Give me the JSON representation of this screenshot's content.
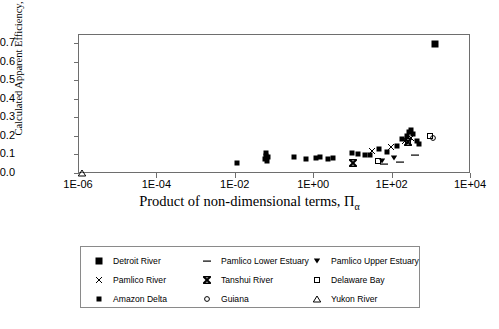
{
  "chart_data": {
    "type": "scatter",
    "title": "",
    "xlabel": "Product of non-dimensional terms, Π",
    "xlabel_sub": "α",
    "ylabel": "Calculated Apparent Efficiency, α'",
    "xscale": "log",
    "yscale": "linear",
    "xlim": [
      1e-06,
      10000.0
    ],
    "ylim": [
      0.0,
      0.75
    ],
    "grid": false,
    "legend_position": "below-plot",
    "xticks": [
      "1E-06",
      "1E-04",
      "1E-02",
      "1E+00",
      "1E+02",
      "1E+04"
    ],
    "xtick_values": [
      1e-06,
      0.0001,
      0.01,
      1,
      100,
      10000
    ],
    "yticks": [
      "0.0",
      "0.1",
      "0.2",
      "0.3",
      "0.4",
      "0.5",
      "0.6",
      "0.7"
    ],
    "ytick_values": [
      0.0,
      0.1,
      0.2,
      0.3,
      0.4,
      0.5,
      0.6,
      0.7
    ],
    "series": [
      {
        "name": "Detroit River",
        "marker": "square-filled",
        "color": "#000000",
        "points": [
          [
            1200.0,
            0.7
          ]
        ]
      },
      {
        "name": "Pamlico Lower Estuary",
        "marker": "dash",
        "color": "#000000",
        "points": [
          [
            62.0,
            0.055
          ],
          [
            150.0,
            0.065
          ],
          [
            380.0,
            0.105
          ]
        ]
      },
      {
        "name": "Pamlico Upper Estuary",
        "marker": "triangle-down-filled",
        "color": "#000000",
        "points": [
          [
            55.0,
            0.072
          ],
          [
            110.0,
            0.085
          ]
        ]
      },
      {
        "name": "Pamlico River",
        "marker": "x-thin",
        "color": "#000000",
        "points": [
          [
            30.0,
            0.122
          ],
          [
            90.0,
            0.148
          ],
          [
            210.0,
            0.178
          ],
          [
            300.0,
            0.192
          ]
        ]
      },
      {
        "name": "Tanshui River",
        "marker": "x-bold",
        "color": "#000000",
        "points": [
          [
            9.5,
            0.058
          ],
          [
            240.0,
            0.17
          ]
        ]
      },
      {
        "name": "Delaware Bay",
        "marker": "square-open",
        "color": "#000000",
        "points": [
          [
            42.0,
            0.068
          ],
          [
            250.0,
            0.168
          ],
          [
            900.0,
            0.205
          ]
        ]
      },
      {
        "name": "Amazon Delta",
        "marker": "square-small-filled",
        "color": "#000000",
        "points": [
          [
            0.011,
            0.062
          ],
          [
            0.055,
            0.082
          ],
          [
            0.06,
            0.098
          ],
          [
            0.06,
            0.112
          ],
          [
            0.062,
            0.072
          ],
          [
            0.065,
            0.09
          ],
          [
            0.3,
            0.092
          ],
          [
            0.6,
            0.08
          ],
          [
            1.1,
            0.085
          ],
          [
            1.4,
            0.09
          ],
          [
            2.2,
            0.082
          ],
          [
            3.0,
            0.086
          ],
          [
            9.0,
            0.112
          ],
          [
            13.0,
            0.108
          ],
          [
            20.0,
            0.1
          ],
          [
            26.0,
            0.104
          ],
          [
            45.0,
            0.135
          ],
          [
            70.0,
            0.118
          ],
          [
            130.0,
            0.15
          ],
          [
            170.0,
            0.19
          ],
          [
            230.0,
            0.205
          ],
          [
            260.0,
            0.228
          ],
          [
            300.0,
            0.24
          ],
          [
            340.0,
            0.215
          ],
          [
            420.0,
            0.178
          ],
          [
            480.0,
            0.16
          ]
        ]
      },
      {
        "name": "Guiana",
        "marker": "circle-open",
        "color": "#000000",
        "points": [
          [
            1100.0,
            0.196
          ]
        ]
      },
      {
        "name": "Yukon River",
        "marker": "triangle-up-open",
        "color": "#000000",
        "points": [
          [
            1.2e-06,
            0.005
          ]
        ]
      }
    ]
  },
  "legend": {
    "rows": [
      [
        {
          "label": "Detroit River",
          "marker": "square-filled"
        },
        {
          "label": "Pamlico Lower Estuary",
          "marker": "dash"
        },
        {
          "label": "Pamlico Upper Estuary",
          "marker": "triangle-down-filled"
        }
      ],
      [
        {
          "label": "Pamlico River",
          "marker": "x-thin"
        },
        {
          "label": "Tanshui River",
          "marker": "x-bold"
        },
        {
          "label": "Delaware Bay",
          "marker": "square-open"
        }
      ],
      [
        {
          "label": "Amazon Delta",
          "marker": "square-small-filled"
        },
        {
          "label": "Guiana",
          "marker": "circle-open"
        },
        {
          "label": "Yukon River",
          "marker": "triangle-up-open"
        }
      ]
    ]
  },
  "colors": {
    "axis": "#6e6e6e",
    "marker": "#000000",
    "legend_border": "#8a8a8a",
    "background": "#ffffff"
  }
}
